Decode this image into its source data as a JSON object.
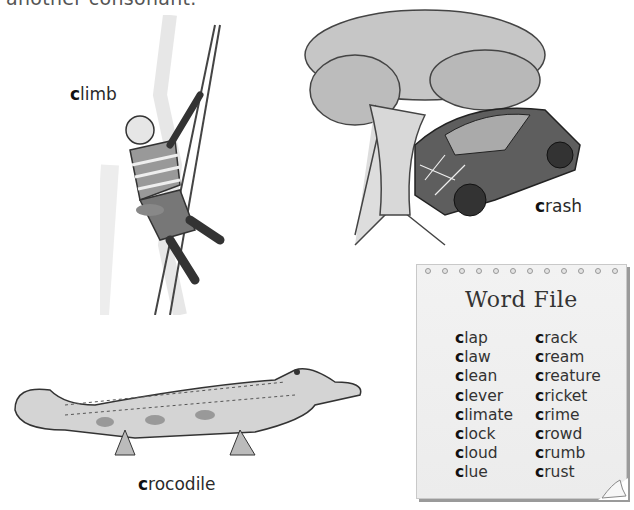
{
  "heading_fragment": "another consonant.",
  "pictures": [
    {
      "id": "climb",
      "first_letter": "c",
      "rest": "limb"
    },
    {
      "id": "crash",
      "first_letter": "c",
      "rest": "rash"
    },
    {
      "id": "crocodile",
      "first_letter": "c",
      "rest": "rocodile"
    }
  ],
  "word_file": {
    "title": "Word File",
    "columns": [
      [
        {
          "first": "c",
          "rest": "lap"
        },
        {
          "first": "c",
          "rest": "law"
        },
        {
          "first": "c",
          "rest": "lean"
        },
        {
          "first": "c",
          "rest": "lever"
        },
        {
          "first": "c",
          "rest": "limate"
        },
        {
          "first": "c",
          "rest": "lock"
        },
        {
          "first": "c",
          "rest": "loud"
        },
        {
          "first": "c",
          "rest": "lue"
        }
      ],
      [
        {
          "first": "c",
          "rest": "rack"
        },
        {
          "first": "c",
          "rest": "ream"
        },
        {
          "first": "c",
          "rest": "reature"
        },
        {
          "first": "c",
          "rest": "ricket"
        },
        {
          "first": "c",
          "rest": "rime"
        },
        {
          "first": "c",
          "rest": "rowd"
        },
        {
          "first": "c",
          "rest": "rumb"
        },
        {
          "first": "c",
          "rest": "rust"
        }
      ]
    ]
  }
}
